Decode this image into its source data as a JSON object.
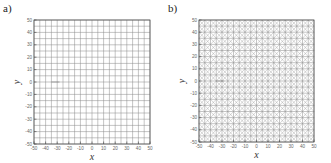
{
  "chart_data": [
    {
      "type": "scatter",
      "panel_label": "a)",
      "title": "",
      "description": "Uniform structured rectangular grid",
      "xlabel": "x",
      "ylabel": "y",
      "xlim": [
        -50,
        50
      ],
      "ylim": [
        -50,
        50
      ],
      "x_ticks": [
        -50,
        -40,
        -30,
        -20,
        -10,
        0,
        10,
        20,
        30,
        40,
        50
      ],
      "y_ticks": [
        -50,
        -40,
        -30,
        -20,
        -10,
        0,
        10,
        20,
        30,
        40,
        50
      ],
      "grid": {
        "divisions_x": 20,
        "divisions_y": 20,
        "spacing": 5,
        "diagonals": false
      },
      "annotation": {
        "type": "short horizontal segment",
        "x": [
          -35,
          -28
        ],
        "y": 0
      }
    },
    {
      "type": "scatter",
      "panel_label": "b)",
      "title": "",
      "description": "Triangulated grid with cross diagonals in each cell",
      "xlabel": "x",
      "ylabel": "y",
      "xlim": [
        -50,
        50
      ],
      "ylim": [
        -50,
        50
      ],
      "x_ticks": [
        -50,
        -40,
        -30,
        -20,
        -10,
        0,
        10,
        20,
        30,
        40,
        50
      ],
      "y_ticks": [
        -50,
        -40,
        -30,
        -20,
        -10,
        0,
        10,
        20,
        30,
        40,
        50
      ],
      "grid": {
        "divisions_x": 20,
        "divisions_y": 20,
        "spacing": 5,
        "diagonals": true
      },
      "annotation": {
        "type": "short horizontal segment",
        "x": [
          -35,
          -28
        ],
        "y": 0
      }
    }
  ],
  "panels": [
    {
      "label": "a)",
      "xlabel": "x",
      "ylabel": "y"
    },
    {
      "label": "b)",
      "xlabel": "x",
      "ylabel": "y"
    }
  ],
  "colors": {
    "grid": "#8a8a8a",
    "frame": "#555555",
    "text": "#555555"
  }
}
